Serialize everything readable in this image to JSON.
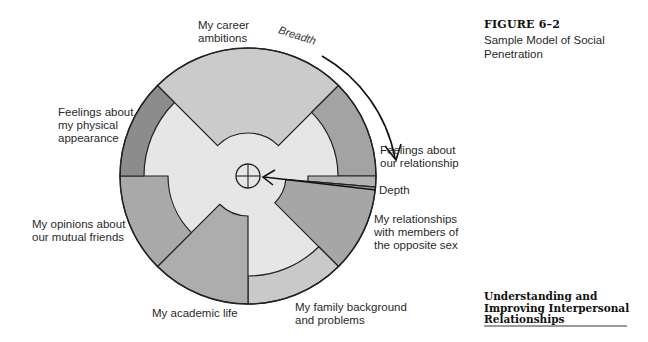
{
  "figure": {
    "number": "FIGURE 6–2",
    "caption": "Sample Model of Social Penetration"
  },
  "book_title": "Understanding and\nImproving Interpersonal\nRelationships",
  "diagram": {
    "center": [
      248,
      176
    ],
    "outer_radius": 128,
    "hub_radius": 12,
    "background_fill": "#e6e6e6",
    "stroke": "#222222",
    "axis_labels": {
      "breadth": "Breadth",
      "depth": "Depth"
    },
    "segments": [
      {
        "label": "My career\nambitions",
        "start_deg": -45,
        "end_deg": 45,
        "inner_radius": 43,
        "fill": "#cbcbcb"
      },
      {
        "label": "Feelings about\nour relationship",
        "start_deg": 45,
        "end_deg": 90,
        "inner_radius": 90,
        "fill": "#a3a3a3"
      },
      {
        "label": "",
        "start_deg": 90,
        "end_deg": 95,
        "inner_radius": 60,
        "fill": "#b2b2b2"
      },
      {
        "label": "My relationships\nwith members of\nthe opposite sex",
        "start_deg": 95,
        "end_deg": 135,
        "inner_radius": 38,
        "fill": "#a6a6a6"
      },
      {
        "label": "My family background\nand problems",
        "start_deg": 135,
        "end_deg": 180,
        "inner_radius": 100,
        "fill": "#c9c9c9"
      },
      {
        "label": "My academic life",
        "start_deg": 180,
        "end_deg": 225,
        "inner_radius": 40,
        "fill": "#adadad"
      },
      {
        "label": "My opinions about\nour mutual friends",
        "start_deg": 225,
        "end_deg": 270,
        "inner_radius": 80,
        "fill": "#a9a9a9"
      },
      {
        "label": "Feelings about\nmy physical\nappearance",
        "start_deg": 270,
        "end_deg": 315,
        "inner_radius": 104,
        "fill": "#8c8c8c"
      }
    ]
  },
  "labels": {
    "career": "My career\nambitions",
    "physical": "Feelings about\nmy physical\nappearance",
    "relationship": "Feelings about\nour relationship",
    "depth": "Depth",
    "opposite_sex": "My relationships\nwith members of\nthe opposite sex",
    "mutual_friends": "My opinions about\nour mutual friends",
    "academic": "My academic life",
    "family": "My family background\nand problems"
  }
}
